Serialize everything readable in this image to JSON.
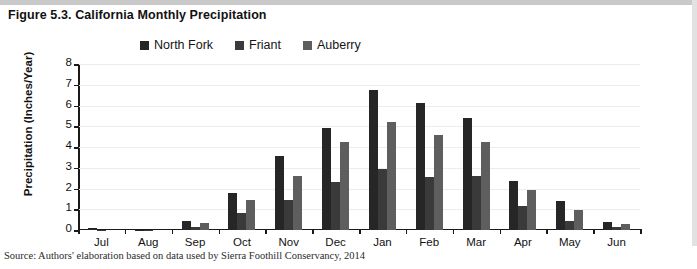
{
  "figure": {
    "title": "Figure 5.3. California Monthly Precipitation",
    "source": "Source: Authors' elaboration based on data used by Sierra Foothill Conservancy, 2014"
  },
  "colors": {
    "north_fork": "#262626",
    "friant": "#3a3a3a",
    "auberry": "#5e5e5e",
    "axis": "#1a1a1a",
    "grid": "#ededed",
    "page_background": "#ffffff",
    "frame": "#d9d9d9"
  },
  "chart_data": {
    "type": "bar",
    "title": "Figure 5.3. California Monthly Precipitation",
    "xlabel": "",
    "ylabel": "Precipitation (Inches/Year)",
    "ylim": [
      0,
      8
    ],
    "yticks": [
      0,
      1,
      2,
      3,
      4,
      5,
      6,
      7,
      8
    ],
    "ytick_labels": [
      "0",
      "1",
      "2",
      "3",
      "4",
      "5",
      "6",
      "7",
      "8"
    ],
    "grid": true,
    "legend_position": "top-center",
    "categories": [
      "Jul",
      "Aug",
      "Sep",
      "Oct",
      "Nov",
      "Dec",
      "Jan",
      "Feb",
      "Mar",
      "Apr",
      "May",
      "Jun"
    ],
    "series": [
      {
        "name": "North Fork",
        "color": "#262626",
        "values": [
          0.1,
          0.02,
          0.45,
          1.8,
          3.55,
          4.9,
          6.75,
          6.1,
          5.4,
          2.35,
          1.4,
          0.4
        ]
      },
      {
        "name": "Friant",
        "color": "#3a3a3a",
        "values": [
          0.02,
          0.02,
          0.15,
          0.8,
          1.45,
          2.3,
          2.95,
          2.55,
          2.6,
          1.15,
          0.45,
          0.15
        ]
      },
      {
        "name": "Auberry",
        "color": "#5e5e5e",
        "values": [
          0.0,
          0.0,
          0.35,
          1.45,
          2.6,
          4.25,
          5.2,
          4.6,
          4.25,
          1.95,
          0.95,
          0.3
        ]
      }
    ]
  }
}
